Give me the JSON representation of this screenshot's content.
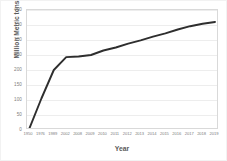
{
  "chart_data": {
    "type": "line",
    "title": "",
    "xlabel": "Year",
    "ylabel": "Million Metric tons",
    "ylim": [
      0,
      400
    ],
    "ytick_step": 50,
    "yticks": [
      0,
      50,
      100,
      150,
      200,
      250,
      300,
      350,
      400
    ],
    "ytick_labels": [
      "0",
      "50",
      "100",
      "150",
      "200",
      "250",
      "300",
      "350",
      "400"
    ],
    "grid": true,
    "grid_axis": "y",
    "legend": "none",
    "categories": [
      "1950",
      "1976",
      "1989",
      "2002",
      "2008",
      "2009",
      "2010",
      "2011",
      "2012",
      "2013",
      "2014",
      "2015",
      "2016",
      "2017",
      "2018",
      "2019"
    ],
    "series": [
      {
        "name": "Global plastic production",
        "color": "#2e2e2e",
        "values": [
          2,
          105,
          200,
          243,
          245,
          250,
          265,
          275,
          288,
          299,
          311,
          322,
          335,
          346,
          354,
          360
        ]
      }
    ]
  },
  "axes": {
    "y_title": "Million Metric tons",
    "x_title": "Year"
  }
}
